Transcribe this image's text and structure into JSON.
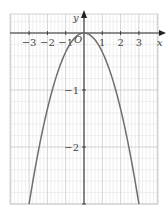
{
  "chart_data": {
    "type": "line",
    "title": "",
    "xlabel": "x",
    "ylabel": "y",
    "origin_label": "O",
    "xlim": [
      -4,
      4
    ],
    "ylim": [
      -3.2,
      0.35
    ],
    "x_ticks": [
      -3,
      -2,
      -1,
      1,
      2,
      3
    ],
    "x_tick_labels": [
      "−3",
      "−2",
      "−1",
      "1",
      "2",
      "3"
    ],
    "y_ticks": [
      -1,
      -2,
      -3
    ],
    "y_tick_labels": [
      "−1",
      "−2",
      ""
    ],
    "grid": true,
    "grid_minor_step": 0.2,
    "series": [
      {
        "name": "y = -x²/3",
        "function": "-x^2/3",
        "x": [
          -3,
          -2.5,
          -2,
          -1.5,
          -1,
          -0.5,
          0,
          0.5,
          1,
          1.5,
          2,
          2.5,
          3
        ],
        "y": [
          -3,
          -2.083,
          -1.333,
          -0.75,
          -0.333,
          -0.083,
          0,
          -0.083,
          -0.333,
          -0.75,
          -1.333,
          -2.083,
          -3
        ]
      }
    ],
    "colors": {
      "curve": "#6e6e6e",
      "axis": "#333333",
      "grid_major": "#c8c8c8",
      "grid_minor": "#e4e4e4"
    }
  },
  "layout": {
    "plot_left": 10,
    "plot_right": 158,
    "plot_top": 14,
    "plot_bottom": 204,
    "origin_px": [
      84,
      33
    ],
    "x_unit_px": 18.3,
    "y_unit_px": 57
  }
}
